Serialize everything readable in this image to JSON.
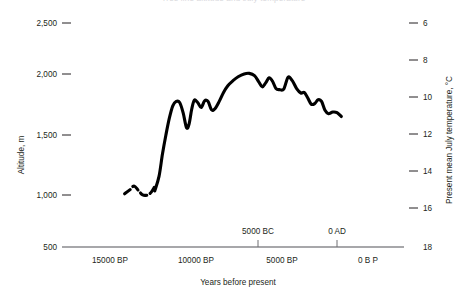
{
  "chart_data": {
    "type": "line",
    "title": "Tree line altitude and July temperature",
    "xlabel": "Years before present",
    "ylabel": "Altitude, m",
    "y2label": "Present mean July temperature, °C",
    "grid": false,
    "legend": null,
    "xlim": [
      16500,
      -1200
    ],
    "ylim": [
      500,
      2500
    ],
    "y2lim": [
      18,
      6
    ],
    "x_ticks_below": [
      {
        "label": "15000 BP",
        "value": 15000
      },
      {
        "label": "10000 BP",
        "value": 10000
      },
      {
        "label": "5000 BP",
        "value": 5000
      },
      {
        "label": "0 B P",
        "value": 0
      }
    ],
    "x_ticks_above": [
      {
        "label": "5000 BC",
        "value": 6950
      },
      {
        "label": "0 AD",
        "value": 1950
      }
    ],
    "y_ticks": [
      {
        "label": "2,500",
        "value": 2500
      },
      {
        "label": "2,000",
        "value": 2000
      },
      {
        "label": "1,500",
        "value": 1500
      },
      {
        "label": "1,000",
        "value": 1000
      },
      {
        "label": "500",
        "value": 500
      }
    ],
    "y2_ticks": [
      {
        "label": "6",
        "value": 6
      },
      {
        "label": "8",
        "value": 8
      },
      {
        "label": "10",
        "value": 10
      },
      {
        "label": "12",
        "value": 12
      },
      {
        "label": "14",
        "value": 14
      },
      {
        "label": "16",
        "value": 16
      },
      {
        "label": "18",
        "value": 18
      }
    ],
    "series": [
      {
        "name": "Tree line altitude (inferred, uncertain)",
        "style": "dashed",
        "points": [
          {
            "x": 14150,
            "y": 975
          },
          {
            "x": 13850,
            "y": 1010
          },
          {
            "x": 13600,
            "y": 1045
          },
          {
            "x": 13350,
            "y": 1005
          },
          {
            "x": 13100,
            "y": 965
          },
          {
            "x": 12800,
            "y": 965
          },
          {
            "x": 12600,
            "y": 990
          },
          {
            "x": 12400,
            "y": 1040
          }
        ]
      },
      {
        "name": "Tree line altitude",
        "style": "solid",
        "points": [
          {
            "x": 12400,
            "y": 1000
          },
          {
            "x": 12150,
            "y": 1130
          },
          {
            "x": 11950,
            "y": 1330
          },
          {
            "x": 11750,
            "y": 1500
          },
          {
            "x": 11550,
            "y": 1650
          },
          {
            "x": 11350,
            "y": 1760
          },
          {
            "x": 11150,
            "y": 1800
          },
          {
            "x": 10950,
            "y": 1790
          },
          {
            "x": 10750,
            "y": 1700
          },
          {
            "x": 10550,
            "y": 1565
          },
          {
            "x": 10400,
            "y": 1600
          },
          {
            "x": 10250,
            "y": 1730
          },
          {
            "x": 10100,
            "y": 1810
          },
          {
            "x": 9900,
            "y": 1790
          },
          {
            "x": 9700,
            "y": 1745
          },
          {
            "x": 9500,
            "y": 1805
          },
          {
            "x": 9300,
            "y": 1800
          },
          {
            "x": 9100,
            "y": 1725
          },
          {
            "x": 8900,
            "y": 1735
          },
          {
            "x": 8650,
            "y": 1800
          },
          {
            "x": 8400,
            "y": 1880
          },
          {
            "x": 8150,
            "y": 1940
          },
          {
            "x": 7850,
            "y": 1985
          },
          {
            "x": 7550,
            "y": 2020
          },
          {
            "x": 7200,
            "y": 2045
          },
          {
            "x": 6900,
            "y": 2050
          },
          {
            "x": 6600,
            "y": 2030
          },
          {
            "x": 6350,
            "y": 1975
          },
          {
            "x": 6150,
            "y": 1930
          },
          {
            "x": 5950,
            "y": 1965
          },
          {
            "x": 5750,
            "y": 2010
          },
          {
            "x": 5550,
            "y": 1980
          },
          {
            "x": 5350,
            "y": 1915
          },
          {
            "x": 5150,
            "y": 1905
          },
          {
            "x": 4900,
            "y": 1910
          },
          {
            "x": 4650,
            "y": 2015
          },
          {
            "x": 4400,
            "y": 1985
          },
          {
            "x": 4150,
            "y": 1915
          },
          {
            "x": 3900,
            "y": 1875
          },
          {
            "x": 3700,
            "y": 1880
          },
          {
            "x": 3500,
            "y": 1830
          },
          {
            "x": 3300,
            "y": 1775
          },
          {
            "x": 3100,
            "y": 1780
          },
          {
            "x": 2900,
            "y": 1815
          },
          {
            "x": 2700,
            "y": 1800
          },
          {
            "x": 2500,
            "y": 1720
          },
          {
            "x": 2300,
            "y": 1690
          },
          {
            "x": 2050,
            "y": 1705
          },
          {
            "x": 1800,
            "y": 1700
          },
          {
            "x": 1550,
            "y": 1665
          }
        ]
      }
    ]
  }
}
